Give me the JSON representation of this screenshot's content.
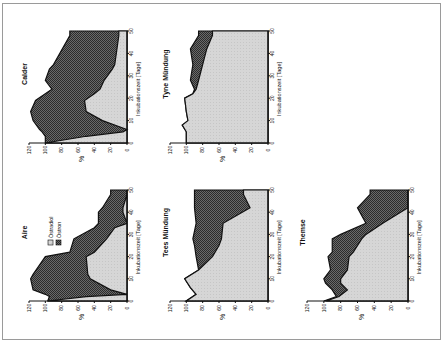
{
  "chart_data": [
    {
      "type": "area",
      "stacked": true,
      "title": "Calder",
      "xlabel": "Inkubationszeit [Tage]",
      "ylabel": "%",
      "xlim": [
        0,
        50
      ],
      "ylim": [
        0,
        120
      ],
      "xticks": [
        0,
        10,
        20,
        30,
        40,
        50
      ],
      "yticks": [
        0,
        20,
        40,
        60,
        80,
        100,
        120
      ],
      "x": [
        0,
        3,
        5,
        6,
        10,
        14,
        19,
        22,
        24,
        28,
        33,
        35,
        48,
        50
      ],
      "series": [
        {
          "name": "Östradiol",
          "values": [
            100,
            50,
            5,
            0,
            30,
            50,
            52,
            40,
            33,
            28,
            18,
            15,
            10,
            10
          ]
        },
        {
          "name": "Östron",
          "values": [
            0,
            50,
            99,
            107,
            85,
            68,
            60,
            60,
            59,
            72,
            77,
            75,
            60,
            60
          ]
        }
      ],
      "totals": [
        100,
        100,
        104,
        107,
        115,
        118,
        112,
        100,
        92,
        100,
        95,
        90,
        70,
        70
      ]
    },
    {
      "type": "area",
      "stacked": true,
      "title": "Tyne Mündung",
      "xlabel": "Inkubationszeit [Tage]",
      "ylabel": "%",
      "xlim": [
        0,
        50
      ],
      "ylim": [
        0,
        120
      ],
      "xticks": [
        0,
        10,
        20,
        30,
        40,
        50
      ],
      "yticks": [
        0,
        20,
        40,
        60,
        80,
        100,
        120
      ],
      "x": [
        0,
        5,
        8,
        10,
        14,
        20,
        22,
        24,
        28,
        35,
        42,
        48,
        50
      ],
      "series": [
        {
          "name": "Östradiol",
          "values": [
            100,
            100,
            105,
            98,
            100,
            102,
            92,
            88,
            85,
            80,
            75,
            68,
            68
          ]
        },
        {
          "name": "Östron",
          "values": [
            0,
            0,
            0,
            0,
            0,
            0,
            0,
            2,
            10,
            12,
            20,
            17,
            17
          ]
        }
      ],
      "totals": [
        100,
        100,
        105,
        98,
        100,
        102,
        92,
        90,
        95,
        92,
        95,
        85,
        85
      ]
    },
    {
      "type": "area",
      "stacked": true,
      "title": "Aire",
      "xlabel": "Inkubationszeit [Tage]",
      "ylabel": "%",
      "xlim": [
        0,
        50
      ],
      "ylim": [
        0,
        120
      ],
      "xticks": [
        0,
        10,
        20,
        30,
        40,
        50
      ],
      "yticks": [
        0,
        20,
        40,
        60,
        80,
        100,
        120
      ],
      "legend": [
        "Östradiol",
        "Östron"
      ],
      "x": [
        0,
        2,
        3,
        5,
        10,
        12,
        20,
        22,
        28,
        33,
        35,
        40,
        42,
        48,
        50
      ],
      "series": [
        {
          "name": "Östradiol",
          "values": [
            97,
            50,
            0,
            20,
            45,
            48,
            50,
            40,
            25,
            15,
            0,
            5,
            5,
            0,
            0
          ]
        },
        {
          "name": "Östron",
          "values": [
            0,
            45,
            100,
            95,
            73,
            67,
            50,
            30,
            40,
            25,
            35,
            30,
            25,
            20,
            20
          ]
        }
      ],
      "totals": [
        97,
        95,
        100,
        115,
        118,
        115,
        100,
        70,
        65,
        40,
        35,
        35,
        30,
        20,
        20
      ]
    },
    {
      "type": "area",
      "stacked": true,
      "title": "Tees Mündung",
      "xlabel": "Inkubationszeit [Tage]",
      "ylabel": "%",
      "xlim": [
        0,
        50
      ],
      "ylim": [
        0,
        120
      ],
      "xticks": [
        0,
        10,
        20,
        30,
        40,
        50
      ],
      "yticks": [
        0,
        20,
        40,
        60,
        80,
        100,
        120
      ],
      "x": [
        0,
        3,
        6,
        10,
        14,
        20,
        25,
        28,
        35,
        42,
        48,
        50
      ],
      "series": [
        {
          "name": "Östradiol",
          "values": [
            100,
            88,
            95,
            102,
            85,
            68,
            60,
            57,
            55,
            22,
            30,
            30
          ]
        },
        {
          "name": "Östron",
          "values": [
            0,
            0,
            0,
            0,
            0,
            20,
            30,
            35,
            33,
            68,
            60,
            60
          ]
        }
      ],
      "totals": [
        100,
        88,
        95,
        102,
        85,
        88,
        90,
        92,
        88,
        90,
        90,
        90
      ]
    },
    {
      "type": "area",
      "stacked": true,
      "title": "Themse",
      "xlabel": "Inkubationszeit [Tage]",
      "ylabel": "%",
      "xlim": [
        0,
        50
      ],
      "ylim": [
        0,
        120
      ],
      "xticks": [
        0,
        10,
        20,
        30,
        40,
        50
      ],
      "yticks": [
        0,
        20,
        40,
        60,
        80,
        100,
        120
      ],
      "x": [
        0,
        2,
        5,
        8,
        10,
        14,
        20,
        22,
        28,
        30,
        35,
        42,
        48,
        50
      ],
      "series": [
        {
          "name": "Östradiol",
          "values": [
            97,
            82,
            72,
            80,
            80,
            72,
            70,
            65,
            55,
            50,
            30,
            0,
            0,
            0
          ]
        },
        {
          "name": "Östron",
          "values": [
            3,
            3,
            18,
            18,
            20,
            20,
            25,
            25,
            35,
            30,
            20,
            60,
            45,
            45
          ]
        }
      ],
      "totals": [
        100,
        85,
        90,
        98,
        100,
        92,
        95,
        90,
        90,
        80,
        50,
        60,
        45,
        45
      ]
    }
  ],
  "figure": {
    "orientation": "rotated-90",
    "legend": [
      {
        "label": "Östradiol",
        "fill": "#d4d4d4"
      },
      {
        "label": "Östron",
        "fill": "#555555"
      }
    ],
    "colors": {
      "light_fill": "#d4d4d4",
      "dark_fill": "#555555",
      "line": "#111111",
      "frame": "#9a9a9a"
    }
  }
}
